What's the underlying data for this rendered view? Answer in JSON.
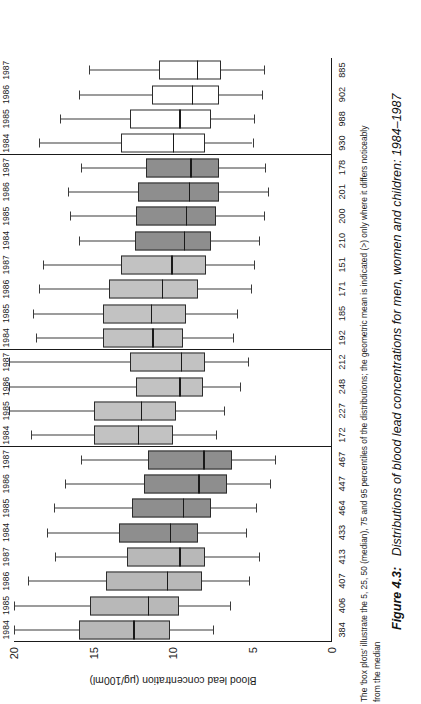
{
  "figure": {
    "number_label": "Figure 4.3:",
    "caption": "Distributions of blood lead concentrations for men, women and children: 1984–1987",
    "note_line1": "The 'box plots' illustrate the 5, 25, 50 (median), 75 and 95 percentiles of the distributions; the geometric mean is indicated (>) only where it differs noticeably",
    "note_line2": "from the median"
  },
  "axis": {
    "title": "Blood lead concentration (μg/100ml)",
    "ticks": [
      "20",
      "15",
      "10",
      "5",
      "0"
    ],
    "tick_values": [
      20,
      15,
      10,
      5,
      0
    ],
    "min": 0,
    "max": 20,
    "n_row_label": ""
  },
  "groups": [
    {
      "name": "Exposed",
      "sub": "Men",
      "fill": "#b8b8b8"
    },
    {
      "name": "",
      "sub": "Women",
      "fill": "#8e8e8e"
    },
    {
      "name": "Police",
      "sub": "Men",
      "fill": "#c2c2c2"
    },
    {
      "name": "Controls",
      "sub": "Men",
      "fill": "#c2c2c2"
    },
    {
      "name": "",
      "sub": "Women",
      "fill": "#8e8e8e"
    },
    {
      "name": "Children",
      "sub": "Men",
      "fill": "#ffffff"
    }
  ],
  "chart_data": {
    "type": "box",
    "title": "Distributions of blood lead concentrations for men, women and children: 1984–1987",
    "xlabel": "",
    "ylabel": "Blood lead concentration (μg/100ml)",
    "ylim": [
      0,
      20
    ],
    "orientation": "horizontal-rotated",
    "grid": false,
    "percentiles": [
      "p5",
      "p25",
      "p50",
      "p75",
      "p95"
    ],
    "categories": [
      "Exposed Men 1984",
      "Exposed Men 1985",
      "Exposed Men 1986",
      "Exposed Men 1987",
      "Exposed Women 1984",
      "Exposed Women 1985",
      "Exposed Women 1986",
      "Exposed Women 1987",
      "Police Men 1984",
      "Police Men 1985",
      "Police Men 1986",
      "Police Men 1987",
      "Controls Men 1984",
      "Controls Men 1985",
      "Controls Men 1986",
      "Controls Men 1987",
      "Controls Women 1984",
      "Controls Women 1985",
      "Controls Women 1986",
      "Controls Women 1987",
      "Children Men 1984",
      "Children Men 1985",
      "Children Men 1986",
      "Children Men 1987"
    ],
    "boxes": [
      {
        "group": "Exposed",
        "sex": "Men",
        "year": "1984",
        "n": "384",
        "p5": 7.5,
        "p25": 10.2,
        "p50": 12.5,
        "p75": 15.9,
        "p95": 20.0
      },
      {
        "group": "Exposed",
        "sex": "Men",
        "year": "1985",
        "n": "406",
        "p5": 6.4,
        "p25": 9.6,
        "p50": 11.6,
        "p75": 15.2,
        "p95": 20.0
      },
      {
        "group": "Exposed",
        "sex": "Men",
        "year": "1986",
        "n": "407",
        "p5": 5.2,
        "p25": 8.2,
        "p50": 10.4,
        "p75": 14.2,
        "p95": 19.1
      },
      {
        "group": "Exposed",
        "sex": "Men",
        "year": "1987",
        "n": "413",
        "p5": 4.6,
        "p25": 8.0,
        "p50": 9.6,
        "p75": 12.9,
        "p95": 17.4
      },
      {
        "group": "Exposed",
        "sex": "Women",
        "year": "1984",
        "n": "433",
        "p5": 5.4,
        "p25": 8.4,
        "p50": 10.2,
        "p75": 13.4,
        "p95": 17.9
      },
      {
        "group": "Exposed",
        "sex": "Women",
        "year": "1985",
        "n": "464",
        "p5": 4.8,
        "p25": 7.6,
        "p50": 9.4,
        "p75": 12.6,
        "p95": 17.5
      },
      {
        "group": "Exposed",
        "sex": "Women",
        "year": "1986",
        "n": "447",
        "p5": 3.9,
        "p25": 6.6,
        "p50": 8.4,
        "p75": 11.8,
        "p95": 16.8
      },
      {
        "group": "Exposed",
        "sex": "Women",
        "year": "1987",
        "n": "467",
        "p5": 3.6,
        "p25": 6.3,
        "p50": 8.1,
        "p75": 11.6,
        "p95": 15.8
      },
      {
        "group": "Police",
        "sex": "Men",
        "year": "1984",
        "n": "172",
        "p5": 7.3,
        "p25": 10.0,
        "p50": 12.2,
        "p75": 15.0,
        "p95": 18.9
      },
      {
        "group": "Police",
        "sex": "Men",
        "year": "1985",
        "n": "227",
        "p5": 6.8,
        "p25": 9.8,
        "p50": 12.0,
        "p75": 15.0,
        "p95": 20.3
      },
      {
        "group": "Police",
        "sex": "Men",
        "year": "1986",
        "n": "248",
        "p5": 5.8,
        "p25": 8.1,
        "p50": 9.6,
        "p75": 12.3,
        "p95": 20.3
      },
      {
        "group": "Police",
        "sex": "Men",
        "year": "1987",
        "n": "212",
        "p5": 5.3,
        "p25": 8.0,
        "p50": 9.5,
        "p75": 12.7,
        "p95": 20.3
      },
      {
        "group": "Controls",
        "sex": "Men",
        "year": "1984",
        "n": "192",
        "p5": 6.2,
        "p25": 9.4,
        "p50": 11.3,
        "p75": 14.4,
        "p95": 18.6
      },
      {
        "group": "Controls",
        "sex": "Men",
        "year": "1985",
        "n": "185",
        "p5": 6.0,
        "p25": 9.2,
        "p50": 11.4,
        "p75": 14.4,
        "p95": 18.8
      },
      {
        "group": "Controls",
        "sex": "Men",
        "year": "1986",
        "n": "171",
        "p5": 5.1,
        "p25": 8.4,
        "p50": 10.7,
        "p75": 14.0,
        "p95": 18.4
      },
      {
        "group": "Controls",
        "sex": "Men",
        "year": "1987",
        "n": "151",
        "p5": 4.9,
        "p25": 7.9,
        "p50": 10.1,
        "p75": 13.3,
        "p95": 18.2
      },
      {
        "group": "Controls",
        "sex": "Women",
        "year": "1984",
        "n": "210",
        "p5": 4.6,
        "p25": 7.6,
        "p50": 9.3,
        "p75": 12.4,
        "p95": 15.9
      },
      {
        "group": "Controls",
        "sex": "Women",
        "year": "1985",
        "n": "200",
        "p5": 4.3,
        "p25": 7.3,
        "p50": 9.2,
        "p75": 12.3,
        "p95": 16.5
      },
      {
        "group": "Controls",
        "sex": "Women",
        "year": "1986",
        "n": "201",
        "p5": 4.0,
        "p25": 7.1,
        "p50": 9.0,
        "p75": 12.2,
        "p95": 16.6
      },
      {
        "group": "Controls",
        "sex": "Women",
        "year": "1987",
        "n": "178",
        "p5": 4.2,
        "p25": 7.1,
        "p50": 8.9,
        "p75": 11.7,
        "p95": 15.8
      },
      {
        "group": "Children",
        "sex": "Men",
        "year": "1984",
        "n": "930",
        "p5": 5.0,
        "p25": 8.0,
        "p50": 10.0,
        "p75": 13.3,
        "p95": 18.4
      },
      {
        "group": "Children",
        "sex": "Men",
        "year": "1985",
        "n": "988",
        "p5": 4.9,
        "p25": 7.6,
        "p50": 9.6,
        "p75": 12.7,
        "p95": 17.1
      },
      {
        "group": "Children",
        "sex": "Men",
        "year": "1986",
        "n": "902",
        "p5": 4.4,
        "p25": 7.1,
        "p50": 8.8,
        "p75": 11.3,
        "p95": 15.9
      },
      {
        "group": "Children",
        "sex": "Men",
        "year": "1987",
        "n": "885",
        "p5": 4.3,
        "p25": 7.0,
        "p50": 8.5,
        "p75": 10.9,
        "p95": 15.3
      }
    ]
  }
}
